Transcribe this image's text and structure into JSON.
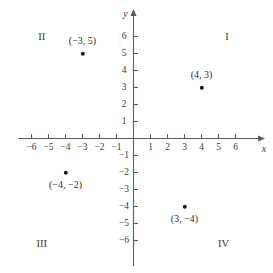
{
  "chart_data": {
    "type": "scatter",
    "title": "",
    "xlabel": "x",
    "ylabel": "y",
    "xlim": [
      -7,
      7
    ],
    "ylim": [
      -7,
      7
    ],
    "grid": false,
    "legend": null,
    "x_ticks": [
      -6,
      -5,
      -4,
      -3,
      -2,
      -1,
      1,
      2,
      3,
      4,
      5,
      6
    ],
    "y_ticks": [
      6,
      5,
      4,
      3,
      2,
      1,
      -1,
      -2,
      -3,
      -4,
      -5,
      -6
    ],
    "x_tick_labels": [
      "−6",
      "−5",
      "−4",
      "−3",
      "−2",
      "−1",
      "1",
      "2",
      "3",
      "4",
      "5",
      "6"
    ],
    "y_tick_labels": [
      "6",
      "5",
      "4",
      "3",
      "2",
      "1",
      "−1",
      "−2",
      "−3",
      "−4",
      "−5",
      "−6"
    ],
    "points": [
      {
        "x": -3,
        "y": 5,
        "label": "(−3, 5)",
        "label_position": "above"
      },
      {
        "x": 4,
        "y": 3,
        "label": "(4, 3)",
        "label_position": "above"
      },
      {
        "x": -4,
        "y": -2,
        "label": "(−4, −2)",
        "label_position": "below"
      },
      {
        "x": 3,
        "y": -4,
        "label": "(3, −4)",
        "label_position": "below"
      }
    ],
    "annotations": [
      {
        "text": "I",
        "x": 5.5,
        "y": 6.0
      },
      {
        "text": "II",
        "x": -5.4,
        "y": 6.0
      },
      {
        "text": "III",
        "x": -5.4,
        "y": -6.2
      },
      {
        "text": "IV",
        "x": 5.3,
        "y": -6.2
      }
    ],
    "colors": {
      "axis": "#5c5c5c",
      "point": "#161616",
      "text": "#2b2b2b",
      "background": "#ffffff"
    }
  },
  "axis_labels": {
    "x": "x",
    "y": "y"
  }
}
